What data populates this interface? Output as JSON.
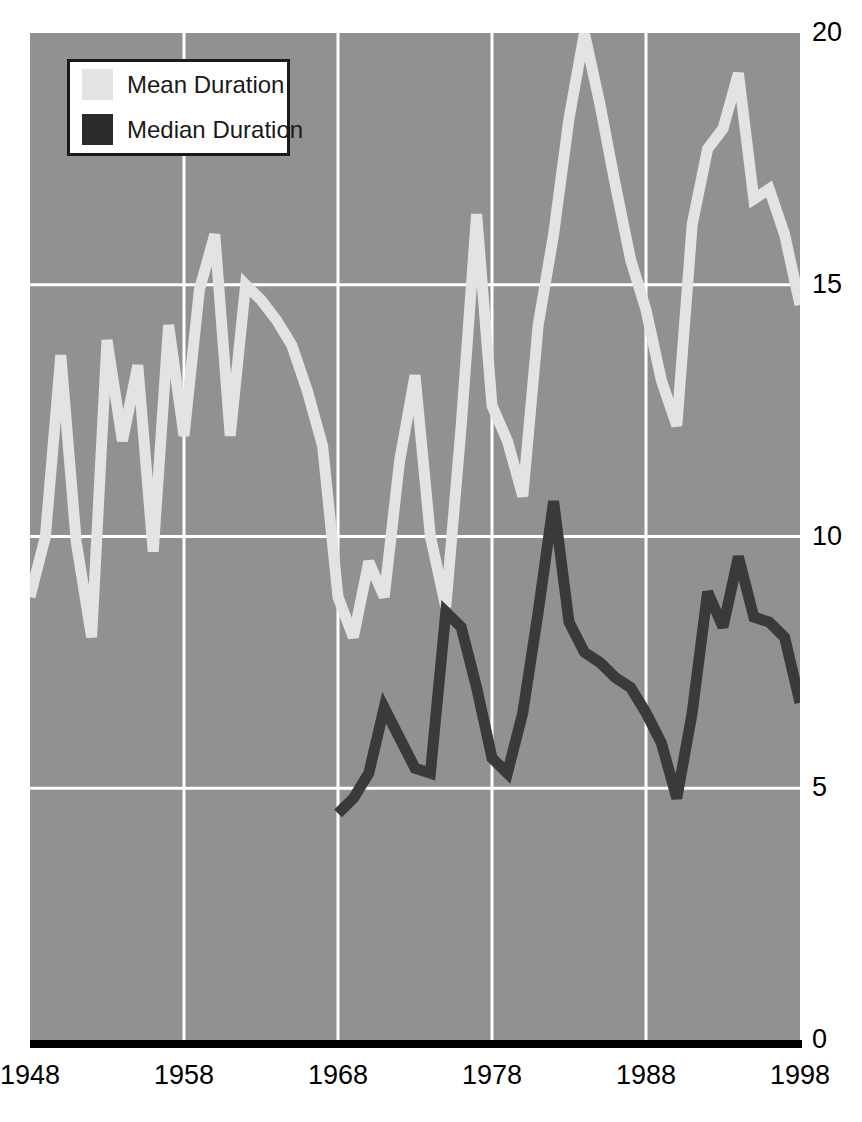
{
  "legend": {
    "position": "top-left",
    "entries": [
      {
        "label": "Mean Duration",
        "color": "#e3e3e3",
        "icon": "legend-swatch-icon"
      },
      {
        "label": "Median Duration",
        "color": "#2b2b2b",
        "icon": "legend-swatch-icon"
      }
    ]
  },
  "axes": {
    "y_ticks": [
      "0",
      "5",
      "10",
      "15",
      "20"
    ],
    "x_ticks": [
      "1948",
      "1958",
      "1968",
      "1978",
      "1988",
      "1998"
    ]
  },
  "colors": {
    "plot_background": "#919191",
    "gridline": "#ffffff",
    "axis": "#000000",
    "mean_line": "#e3e3e3",
    "median_line": "#3a3a3a",
    "page_background": "#ffffff"
  },
  "chart_data": {
    "type": "line",
    "title": "",
    "subtitle": "",
    "xlabel": "",
    "ylabel": "",
    "xlim": [
      1948,
      1998
    ],
    "ylim": [
      0,
      20
    ],
    "grid": true,
    "x_tick_values": [
      1948,
      1958,
      1968,
      1978,
      1988,
      1998
    ],
    "y_tick_values": [
      0,
      5,
      10,
      15,
      20
    ],
    "legend_position": "top-left",
    "x": [
      1948,
      1949,
      1950,
      1951,
      1952,
      1953,
      1954,
      1955,
      1956,
      1957,
      1958,
      1959,
      1960,
      1961,
      1962,
      1963,
      1964,
      1965,
      1966,
      1967,
      1968,
      1969,
      1970,
      1971,
      1972,
      1973,
      1974,
      1975,
      1976,
      1977,
      1978,
      1979,
      1980,
      1981,
      1982,
      1983,
      1984,
      1985,
      1986,
      1987,
      1988,
      1989,
      1990,
      1991,
      1992,
      1993,
      1994,
      1995,
      1996,
      1997,
      1998
    ],
    "series": [
      {
        "name": "Mean Duration",
        "color": "#e3e3e3",
        "values": [
          8.8,
          10.0,
          13.6,
          9.9,
          8.0,
          13.9,
          11.9,
          13.4,
          9.7,
          14.2,
          12.0,
          14.9,
          16.0,
          12.0,
          15.0,
          14.7,
          14.3,
          13.8,
          12.9,
          11.8,
          8.8,
          8.0,
          9.5,
          8.8,
          11.5,
          13.2,
          10.0,
          8.6,
          12.2,
          16.4,
          12.6,
          11.9,
          10.8,
          14.2,
          16.0,
          18.3,
          20.0,
          18.6,
          17.0,
          15.5,
          14.5,
          13.1,
          12.2,
          16.2,
          17.7,
          18.1,
          19.2,
          16.7,
          16.9,
          16.0,
          14.6
        ]
      },
      {
        "name": "Median Duration",
        "color": "#3a3a3a",
        "values": [
          null,
          null,
          null,
          null,
          null,
          null,
          null,
          null,
          null,
          null,
          null,
          null,
          null,
          null,
          null,
          null,
          null,
          null,
          null,
          null,
          4.5,
          4.8,
          5.3,
          6.6,
          6.0,
          5.4,
          5.3,
          8.5,
          8.2,
          7.0,
          5.6,
          5.3,
          6.5,
          8.5,
          10.7,
          8.3,
          7.7,
          7.5,
          7.2,
          7.0,
          6.5,
          5.9,
          4.8,
          6.5,
          8.9,
          8.2,
          9.6,
          8.4,
          8.3,
          8.0,
          6.7
        ]
      }
    ]
  }
}
